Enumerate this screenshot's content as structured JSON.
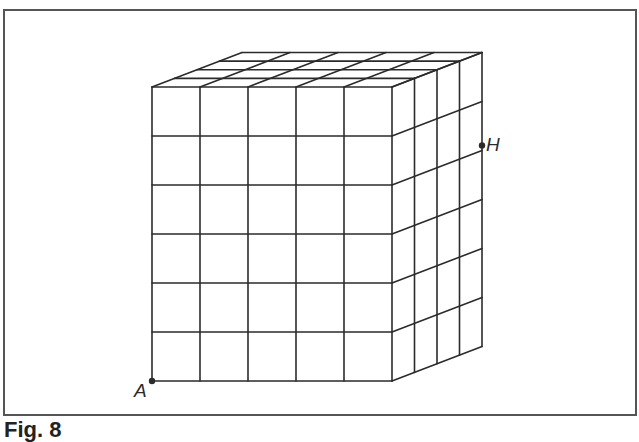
{
  "figure": {
    "caption": "Fig. 8",
    "grid": {
      "front_columns": 5,
      "front_rows": 6,
      "depth_divisions": 4
    },
    "points": [
      {
        "label": "A",
        "position": "bottom-left front corner"
      },
      {
        "label": "H",
        "position": "right back edge, second grid line from top"
      }
    ],
    "colors": {
      "line": "#2b2b2b",
      "frame": "#555555",
      "background": "#ffffff"
    }
  }
}
